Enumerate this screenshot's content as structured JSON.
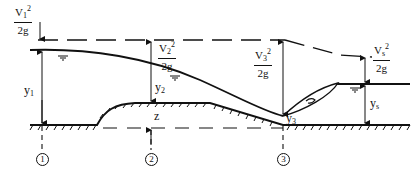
{
  "diagram": {
    "velocity_heads": [
      {
        "id": "v1",
        "num": "V",
        "sub": "1",
        "sup": "2",
        "den": "2g"
      },
      {
        "id": "v2",
        "num": "V",
        "sub": "2",
        "sup": "2",
        "den": "2g"
      },
      {
        "id": "v3",
        "num": "V",
        "sub": "3",
        "sup": "2",
        "den": "2g"
      },
      {
        "id": "vs",
        "num": "V",
        "sub": "s",
        "sup": "2",
        "den": "2g"
      }
    ],
    "depths": [
      {
        "id": "y1",
        "base": "y",
        "sub": "1"
      },
      {
        "id": "y2",
        "base": "y",
        "sub": "2"
      },
      {
        "id": "y3",
        "base": "y",
        "sub": "3"
      },
      {
        "id": "ys",
        "base": "y",
        "sub": "s"
      }
    ],
    "hump_height_label": "z",
    "sections": [
      "1",
      "2",
      "3"
    ],
    "elements": [
      "energy line (dashed)",
      "water surface",
      "channel bed",
      "datum line (dashed)",
      "hydraulic jump roller"
    ]
  }
}
